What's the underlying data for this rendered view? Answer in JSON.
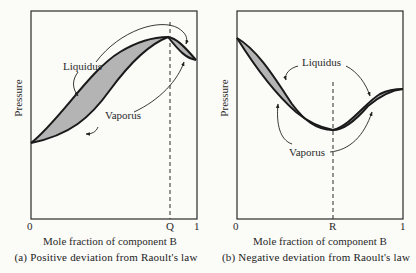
{
  "panels": [
    {
      "id": "a",
      "caption": "(a) Positive deviation from Raoult's law",
      "xlabel": "Mole fraction of component B",
      "ylabel": "Pressure",
      "x_ticks": [
        "0",
        "Q",
        "1"
      ],
      "curve_labels": {
        "liquidus": "Liquidus",
        "vaporus": "Vaporus"
      },
      "marker": "Q",
      "feature": "maximum-pressure azeotrope"
    },
    {
      "id": "b",
      "caption": "(b) Negative deviation from Raoult's law",
      "xlabel": "Mole fraction of component B",
      "ylabel": "Pressure",
      "x_ticks": [
        "0",
        "R",
        "1"
      ],
      "curve_labels": {
        "liquidus": "Liquidus",
        "vaporus": "Vaporus"
      },
      "marker": "R",
      "feature": "minimum-pressure azeotrope"
    }
  ],
  "colors": {
    "curve": "#1a1a1a",
    "fill": "#b4b4b4",
    "frame": "#2a2a2a",
    "background": "#fbfbf8"
  }
}
